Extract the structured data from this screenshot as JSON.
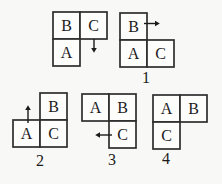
{
  "colors": {
    "background": "#f8f8f6",
    "cell_fill": "#fdfdfc",
    "line": "#2e2e2e",
    "ink": "#1b1b1b"
  },
  "cell_size": 27,
  "figures": [
    {
      "name": "example",
      "label": "",
      "origin": {
        "x": 53,
        "y": 12
      },
      "cells": [
        {
          "letter": "B",
          "col": 0,
          "row": 0
        },
        {
          "letter": "C",
          "col": 1,
          "row": 0
        },
        {
          "letter": "A",
          "col": 0,
          "row": 1
        }
      ],
      "arrow": {
        "direction": "down",
        "col": 1,
        "row": 0
      }
    },
    {
      "name": "option-1",
      "label": "1",
      "label_pos": {
        "x": 146,
        "y": 77
      },
      "origin": {
        "x": 120,
        "y": 13
      },
      "cells": [
        {
          "letter": "B",
          "col": 0,
          "row": 0
        },
        {
          "letter": "A",
          "col": 0,
          "row": 1
        },
        {
          "letter": "C",
          "col": 1,
          "row": 1
        }
      ],
      "arrow": {
        "direction": "right",
        "col": 0,
        "row": 0
      }
    },
    {
      "name": "option-2",
      "label": "2",
      "label_pos": {
        "x": 40,
        "y": 160
      },
      "origin": {
        "x": 13,
        "y": 93
      },
      "cells": [
        {
          "letter": "B",
          "col": 1,
          "row": 0
        },
        {
          "letter": "A",
          "col": 0,
          "row": 1
        },
        {
          "letter": "C",
          "col": 1,
          "row": 1
        }
      ],
      "arrow": {
        "direction": "up",
        "col": 0,
        "row": 1
      }
    },
    {
      "name": "option-3",
      "label": "3",
      "label_pos": {
        "x": 112,
        "y": 159
      },
      "origin": {
        "x": 82,
        "y": 94
      },
      "cells": [
        {
          "letter": "A",
          "col": 0,
          "row": 0
        },
        {
          "letter": "B",
          "col": 1,
          "row": 0
        },
        {
          "letter": "C",
          "col": 1,
          "row": 1
        }
      ],
      "arrow": {
        "direction": "left",
        "col": 1,
        "row": 1
      }
    },
    {
      "name": "option-4",
      "label": "4",
      "label_pos": {
        "x": 166,
        "y": 158
      },
      "origin": {
        "x": 153,
        "y": 95
      },
      "cells": [
        {
          "letter": "A",
          "col": 0,
          "row": 0
        },
        {
          "letter": "B",
          "col": 1,
          "row": 0
        },
        {
          "letter": "C",
          "col": 0,
          "row": 1
        }
      ],
      "arrow": null
    }
  ]
}
